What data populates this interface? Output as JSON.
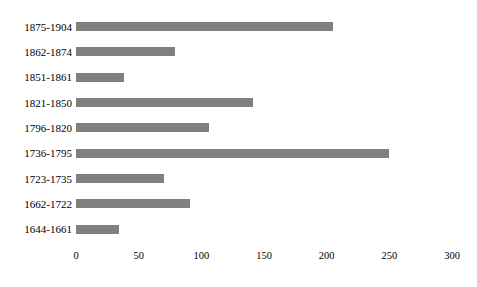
{
  "chart_data": {
    "type": "bar",
    "orientation": "horizontal",
    "title": "",
    "subtitle": "",
    "xlabel": "",
    "ylabel": "",
    "categories": [
      "1875-1904",
      "1862-1874",
      "1851-1861",
      "1821-1850",
      "1796-1820",
      "1736-1795",
      "1723-1735",
      "1662-1722",
      "1644-1661"
    ],
    "values": [
      205,
      79,
      38,
      141,
      106,
      250,
      70,
      91,
      34
    ],
    "xlim": [
      0,
      300
    ],
    "xticks": [
      0,
      50,
      100,
      150,
      200,
      250,
      300
    ],
    "xtick_labels": [
      "0",
      "50",
      "100",
      "150",
      "200",
      "250",
      "300"
    ],
    "grid": false,
    "legend": false,
    "legend_position": "none",
    "bar_color": "#808080",
    "background_color": "#ffffff",
    "text_color": "#000000"
  }
}
